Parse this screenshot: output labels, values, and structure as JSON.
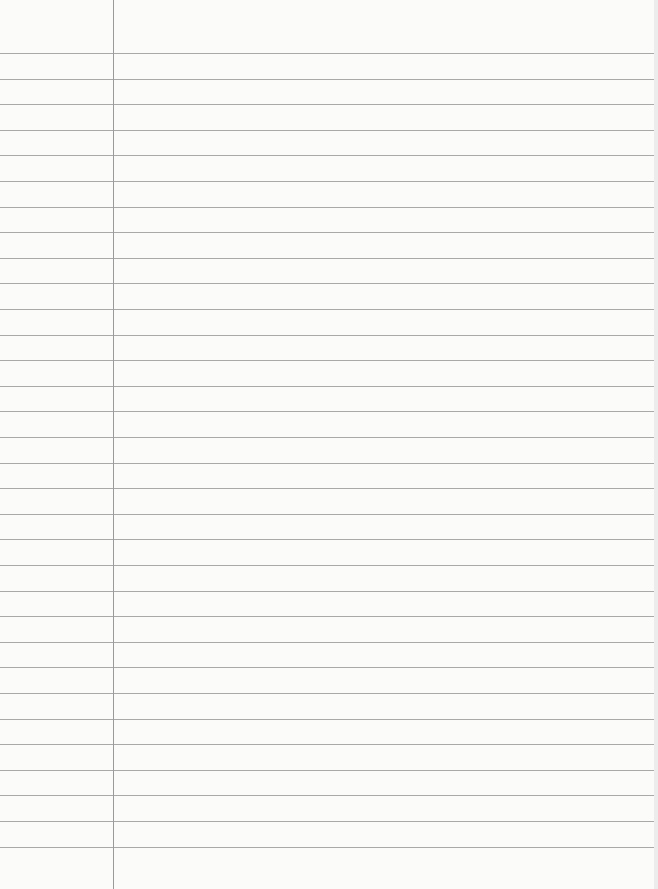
{
  "page": {
    "type": "lined-notebook-paper",
    "background_color": "#fbfbfa",
    "rule_color": "#a9a9a9",
    "margin_color": "#9a9a9a",
    "margin_x": 113,
    "first_rule_y": 53,
    "rule_spacing": 25.6,
    "rule_count": 32
  }
}
